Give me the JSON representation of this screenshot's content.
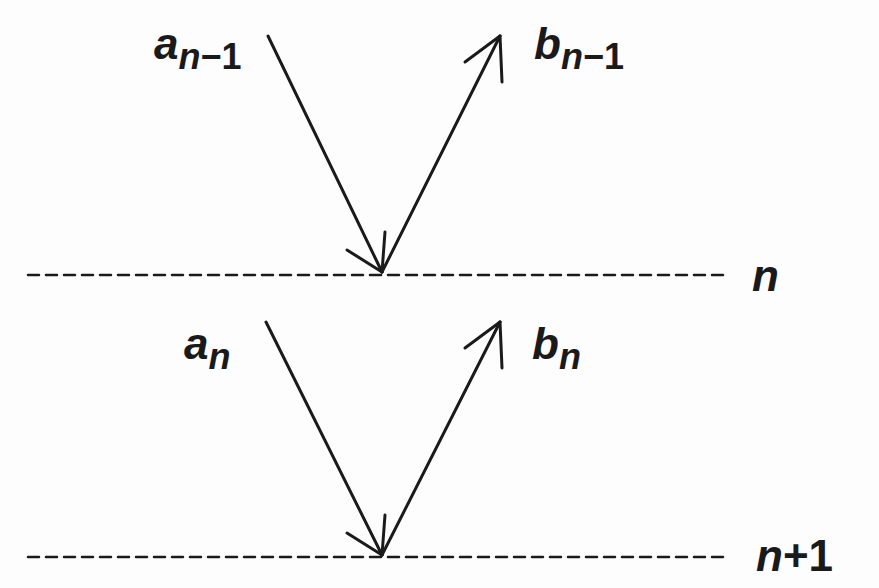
{
  "diagram": {
    "incoming_label_upper": {
      "base": "a",
      "sub_var": "n",
      "sub_rest": "−1"
    },
    "outgoing_label_upper": {
      "base": "b",
      "sub_var": "n",
      "sub_rest": "−1"
    },
    "incoming_label_lower": {
      "base": "a",
      "sub_var": "n"
    },
    "outgoing_label_lower": {
      "base": "b",
      "sub_var": "n"
    },
    "interface_upper": {
      "var": "n",
      "rest": ""
    },
    "interface_lower": {
      "var": "n",
      "rest": "+1"
    },
    "stroke_color": "#1a1a1a"
  }
}
